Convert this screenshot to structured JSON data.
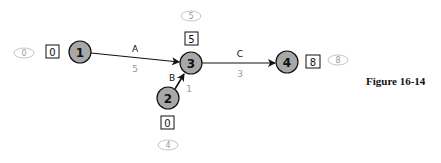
{
  "figure": {
    "caption": "Figure 16-14",
    "colors": {
      "node_fill": "#a8a8a8",
      "stroke": "#111111",
      "oval_stroke": "#b8b8b8",
      "faint_text": "#999999"
    }
  },
  "nodes": [
    {
      "id": "1",
      "label": "1",
      "early_start": "0",
      "late_value": "0"
    },
    {
      "id": "2",
      "label": "2",
      "early_start": "0",
      "late_value": "4"
    },
    {
      "id": "3",
      "label": "3",
      "early_start": "5",
      "late_value": "5"
    },
    {
      "id": "4",
      "label": "4",
      "early_start": "8",
      "late_value": "8"
    }
  ],
  "activities": [
    {
      "name": "A",
      "from": "1",
      "to": "3",
      "duration": "5"
    },
    {
      "name": "B",
      "from": "2",
      "to": "3",
      "duration": "1"
    },
    {
      "name": "C",
      "from": "3",
      "to": "4",
      "duration": "3"
    }
  ]
}
